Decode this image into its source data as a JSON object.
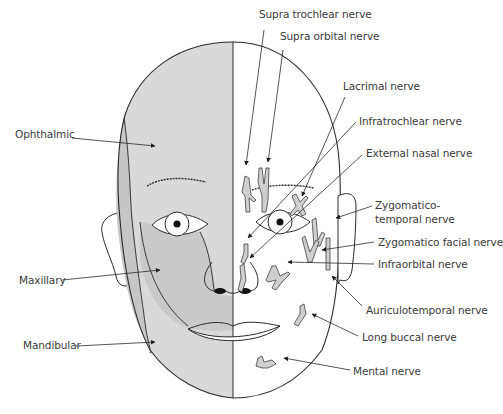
{
  "diagram": {
    "colors": {
      "shade_light": "#dcdcdc",
      "shade_dark": "#c4c4c4",
      "outline": "#2b2b2b",
      "nerve_fill": "#cfcfcf",
      "text": "#3a3a3a",
      "background": "#ffffff"
    },
    "left_labels": [
      {
        "id": "ophthalmic",
        "text": "Ophthalmic",
        "x": 15,
        "y": 134
      },
      {
        "id": "maxillary",
        "text": "Maxillary",
        "x": 19,
        "y": 274
      },
      {
        "id": "mandibular",
        "text": "Mandibular",
        "x": 23,
        "y": 340
      }
    ],
    "right_labels": [
      {
        "id": "supra-trochlear",
        "text": "Supra trochlear nerve",
        "x": 259,
        "y": 15
      },
      {
        "id": "supra-orbital",
        "text": "Supra orbital nerve",
        "x": 280,
        "y": 37
      },
      {
        "id": "lacrimal",
        "text": "Lacrimal nerve",
        "x": 343,
        "y": 80
      },
      {
        "id": "infratrochlear",
        "text": "Infratrochlear nerve",
        "x": 359,
        "y": 115
      },
      {
        "id": "external-nasal",
        "text": "External nasal nerve",
        "x": 366,
        "y": 147
      },
      {
        "id": "zygomatico-temporal-1",
        "text": "Zygomatico-",
        "x": 375,
        "y": 200
      },
      {
        "id": "zygomatico-temporal-2",
        "text": "temporal nerve",
        "x": 375,
        "y": 213
      },
      {
        "id": "zygomatico-facial",
        "text": "Zygomatico facial nerve",
        "x": 378,
        "y": 236
      },
      {
        "id": "infraorbital",
        "text": "Infraorbital nerve",
        "x": 378,
        "y": 258
      },
      {
        "id": "auriculotemporal",
        "text": "Auriculotemporal nerve",
        "x": 366,
        "y": 305
      },
      {
        "id": "long-buccal",
        "text": "Long buccal nerve",
        "x": 362,
        "y": 331
      },
      {
        "id": "mental",
        "text": "Mental nerve",
        "x": 353,
        "y": 364
      }
    ]
  }
}
